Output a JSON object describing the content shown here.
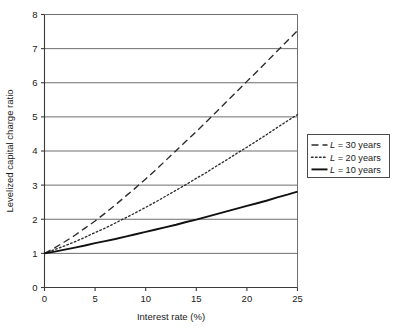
{
  "chart_data": {
    "type": "line",
    "title": "",
    "xlabel": "Interest rate (%)",
    "ylabel": "Levelized capital charge ratio",
    "xlim": [
      0,
      25
    ],
    "ylim": [
      0,
      8
    ],
    "xticks": [
      "0",
      "5",
      "10",
      "15",
      "20",
      "25"
    ],
    "yticks": [
      "0",
      "1",
      "2",
      "3",
      "4",
      "5",
      "6",
      "7",
      "8"
    ],
    "xtick_values": [
      0,
      5,
      10,
      15,
      20,
      25
    ],
    "ytick_values": [
      0,
      1,
      2,
      3,
      4,
      5,
      6,
      7,
      8
    ],
    "grid": "horizontal",
    "legend_position": "right-outside",
    "x": [
      0,
      1,
      2,
      3,
      4,
      5,
      6,
      7,
      8,
      9,
      10,
      11,
      12,
      13,
      14,
      15,
      16,
      17,
      18,
      19,
      20,
      21,
      22,
      23,
      24,
      25
    ],
    "series": [
      {
        "name": "L = 30 years",
        "label_prefix": "L",
        "label_rest": " = 30 years",
        "style": "dashed",
        "color": "#2b2b2b",
        "values": [
          1.0,
          1.16,
          1.34,
          1.53,
          1.74,
          1.95,
          2.18,
          2.42,
          2.67,
          2.92,
          3.18,
          3.45,
          3.73,
          4.01,
          4.29,
          4.57,
          4.86,
          5.15,
          5.45,
          5.74,
          6.04,
          6.33,
          6.63,
          6.93,
          7.23,
          7.53
        ]
      },
      {
        "name": "L = 20 years",
        "label_prefix": "L",
        "label_rest": " = 20 years",
        "style": "dotted",
        "color": "#2b2b2b",
        "values": [
          1.0,
          1.11,
          1.22,
          1.34,
          1.47,
          1.61,
          1.74,
          1.89,
          2.04,
          2.19,
          2.35,
          2.51,
          2.68,
          2.85,
          3.02,
          3.2,
          3.37,
          3.56,
          3.74,
          3.93,
          4.11,
          4.3,
          4.49,
          4.69,
          4.88,
          5.07
        ]
      },
      {
        "name": "L = 10 years",
        "label_prefix": "L",
        "label_rest": " = 10 years",
        "style": "solid",
        "color": "#111111",
        "values": [
          1.0,
          1.05,
          1.11,
          1.17,
          1.23,
          1.3,
          1.36,
          1.42,
          1.49,
          1.56,
          1.63,
          1.7,
          1.77,
          1.84,
          1.92,
          1.99,
          2.07,
          2.15,
          2.23,
          2.31,
          2.39,
          2.47,
          2.55,
          2.64,
          2.72,
          2.81
        ]
      }
    ],
    "legend_entries": [
      {
        "marker": "dashed",
        "prefix": "L",
        "text": " = 30 years"
      },
      {
        "marker": "dotted",
        "prefix": "L",
        "text": " = 20 years"
      },
      {
        "marker": "solid",
        "prefix": "L",
        "text": " = 10 years"
      }
    ],
    "colors": {
      "axis": "#3a3a3a",
      "grid": "#6e6e6e",
      "text": "#1a1a1a",
      "background": "#ffffff",
      "legend_border": "#4a4a4a"
    }
  }
}
